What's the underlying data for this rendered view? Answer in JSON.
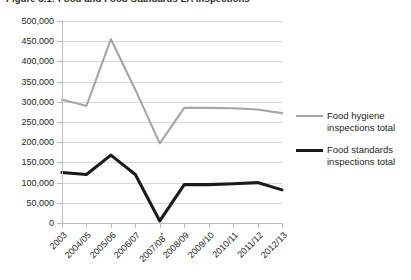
{
  "figure": {
    "title": "Figure 3.1: Food and Food Standards LA Inspections"
  },
  "colors": {
    "food_hygiene": "#a6a6a6",
    "food_standards": "#1a1a1a",
    "gridline": "#d8d8d8",
    "axis": "#bdbdbd",
    "text": "#231f20",
    "background": "#ffffff"
  },
  "legend": {
    "position": "right",
    "items": [
      {
        "label": "Food hygiene inspections total",
        "color": "#a6a6a6",
        "width": 2.2
      },
      {
        "label": "Food standards inspections total",
        "color": "#1a1a1a",
        "width": 3.2
      }
    ]
  },
  "axes": {
    "y_tick_labels": [
      "500,000",
      "450,000",
      "400,000",
      "350,000",
      "300,000",
      "250,000",
      "200,000",
      "150,000",
      "100,000",
      "50,000",
      "0"
    ],
    "x_tick_labels": [
      "2003",
      "2004/05",
      "2005/06",
      "2006/07",
      "2007/08*",
      "2008/09",
      "2009/10",
      "2010/11",
      "2011/12",
      "2012/13"
    ]
  },
  "chart_data": {
    "type": "line",
    "title": "Figure 3.1: Food and Food Standards LA Inspections",
    "xlabel": "",
    "ylabel": "",
    "ylim": [
      0,
      500000
    ],
    "ytick_step": 50000,
    "grid": true,
    "legend_position": "right",
    "categories": [
      "2003",
      "2004/05",
      "2005/06",
      "2006/07",
      "2007/08*",
      "2008/09",
      "2009/10",
      "2010/11",
      "2011/12",
      "2012/13"
    ],
    "series": [
      {
        "name": "Food hygiene inspections total",
        "color": "#a6a6a6",
        "values": [
          305000,
          290000,
          455000,
          330000,
          197000,
          285000,
          285000,
          284000,
          281000,
          272000
        ]
      },
      {
        "name": "Food standards inspections total",
        "color": "#1a1a1a",
        "values": [
          125000,
          120000,
          168000,
          120000,
          5000,
          95000,
          95000,
          97000,
          100000,
          82000
        ]
      }
    ],
    "annotations": [
      {
        "text": "*",
        "target": "2007/08",
        "note": "asterisk marks 2007/08 category label"
      }
    ]
  }
}
